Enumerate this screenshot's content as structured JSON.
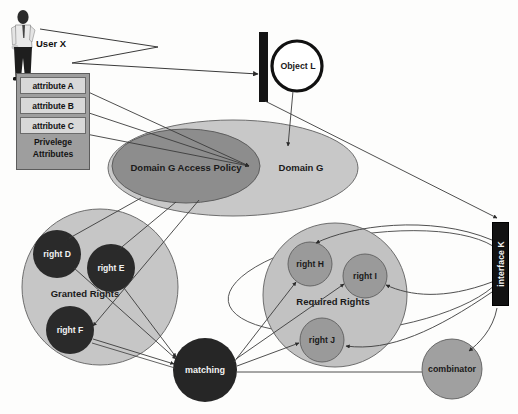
{
  "diagram": {
    "background_color": "#fdfdfc"
  },
  "actor": {
    "icon": "person-icon",
    "label": "User X"
  },
  "privilege_attributes": {
    "caption_line1": "Privelege",
    "caption_line2": "Attributes",
    "panel_color": "#9e9e9e",
    "items": [
      {
        "label": "attribute A"
      },
      {
        "label": "attribute B"
      },
      {
        "label": "attribute C"
      }
    ]
  },
  "object": {
    "label": "Object L",
    "bar_color": "#141414",
    "circle_stroke": "#111111"
  },
  "domain": {
    "outer_label": "Domain G",
    "outer_color": "#c8c8c8",
    "inner_label": "Domain G Access Policy",
    "inner_color": "#8d8d8d"
  },
  "granted_rights": {
    "group_label": "Granted Rights",
    "group_color": "#c6c6c6",
    "node_color": "#2a2a2a",
    "nodes": [
      {
        "label": "right D"
      },
      {
        "label": "right E"
      },
      {
        "label": "right F"
      }
    ]
  },
  "required_rights": {
    "group_label": "Required Rights",
    "group_color": "#c2c2c2",
    "node_color": "#9a9a9a",
    "nodes": [
      {
        "label": "right H"
      },
      {
        "label": "right I"
      },
      {
        "label": "right J"
      }
    ]
  },
  "matching": {
    "label": "matching",
    "color": "#262626"
  },
  "combinator": {
    "label": "combinator",
    "color": "#a0a0a0"
  },
  "interface": {
    "label": "interface K",
    "color": "#121212"
  }
}
